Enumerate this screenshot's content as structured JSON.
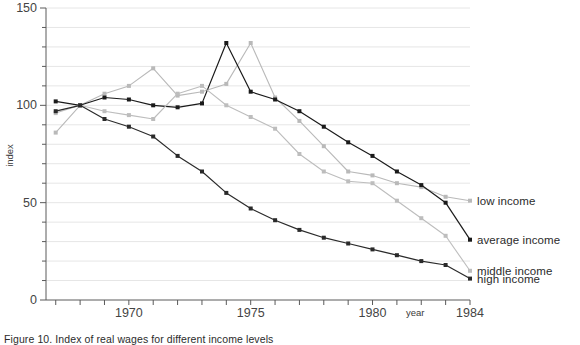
{
  "chart_data": {
    "type": "line",
    "title": "",
    "xlabel": "year",
    "ylabel": "index",
    "xlim": [
      1966.6,
      1984
    ],
    "ylim": [
      0,
      150
    ],
    "grid": true,
    "grid_step": 10,
    "legend_position": "right-inline",
    "x": [
      1967,
      1968,
      1969,
      1970,
      1971,
      1972,
      1973,
      1974,
      1975,
      1976,
      1977,
      1978,
      1979,
      1980,
      1981,
      1982,
      1983,
      1984
    ],
    "xticks": [
      1970,
      1975,
      1980,
      1984
    ],
    "xtick_labels": [
      "1970",
      "1975",
      "1980",
      "1984"
    ],
    "yticks": [
      0,
      50,
      100,
      150
    ],
    "ytick_labels": [
      "0",
      "50",
      "100",
      "150"
    ],
    "series": [
      {
        "name": "low income",
        "color": "#b9b9b9",
        "marker": "square",
        "values": [
          86,
          100,
          106,
          110,
          119,
          105,
          107,
          111,
          132,
          104,
          92,
          79,
          66,
          64,
          60,
          58,
          53,
          null
        ]
      },
      {
        "name": "average income",
        "color": "#1a1a1a",
        "marker": "square",
        "values": [
          102,
          100,
          104,
          103,
          100,
          99,
          101,
          132,
          107,
          103,
          97,
          89,
          81,
          74,
          66,
          59,
          50,
          null
        ]
      },
      {
        "name": "middle income",
        "color": "#bdbdbd",
        "marker": "square",
        "values": [
          96,
          100,
          97,
          95,
          93,
          106,
          110,
          100,
          94,
          88,
          75,
          66,
          61,
          60,
          51,
          42,
          33,
          null
        ]
      },
      {
        "name": "high income",
        "color": "#2a2a2a",
        "marker": "square",
        "values": [
          97,
          100,
          93,
          89,
          84,
          74,
          66,
          55,
          47,
          41,
          36,
          32,
          29,
          26,
          23,
          20,
          18,
          null
        ]
      }
    ],
    "legend_labels": [
      {
        "label": "low income",
        "value_at_end": 51
      },
      {
        "label": "average income",
        "value_at_end": 31
      },
      {
        "label": "middle income",
        "value_at_end": 15
      },
      {
        "label": "high income",
        "value_at_end": 11
      }
    ]
  },
  "caption": {
    "text": "Figure 10.  Index of real wages for different income levels"
  }
}
